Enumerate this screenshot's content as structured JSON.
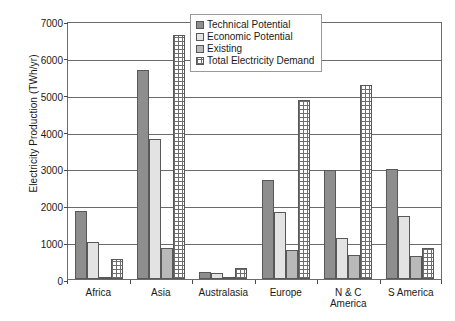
{
  "chart_data": {
    "type": "bar",
    "title": "",
    "xlabel": "",
    "ylabel": "Electricity Production (TWh/yr)",
    "ylim": [
      0,
      7000
    ],
    "ytick_values": [
      0,
      1000,
      2000,
      3000,
      4000,
      5000,
      6000,
      7000
    ],
    "ytick_labels": [
      "0",
      "1000",
      "2000",
      "3000",
      "4000",
      "5000",
      "6000",
      "7000"
    ],
    "grid": true,
    "legend_position": "top-center",
    "categories": [
      "Africa",
      "Asia",
      "Australasia",
      "Europe",
      "N & C America",
      "S America"
    ],
    "category_labels_multiline": [
      [
        "Africa"
      ],
      [
        "Asia"
      ],
      [
        "Australasia"
      ],
      [
        "Europe"
      ],
      [
        "N & C",
        "America"
      ],
      [
        "S America"
      ]
    ],
    "series": [
      {
        "name": "Technical Potential",
        "pattern": "solid-dark-gray",
        "values": [
          1850,
          5680,
          200,
          2680,
          2970,
          2980
        ]
      },
      {
        "name": "Economic Potential",
        "pattern": "dotted-stipple",
        "values": [
          1000,
          3800,
          150,
          1820,
          1100,
          1720
        ]
      },
      {
        "name": "Existing",
        "pattern": "solid-light-gray",
        "values": [
          60,
          830,
          40,
          800,
          650,
          620
        ]
      },
      {
        "name": "Total Electricity Demand",
        "pattern": "crosshatch",
        "values": [
          550,
          6630,
          300,
          4850,
          5270,
          830
        ]
      }
    ]
  },
  "colors": {
    "series_technical": "#8e8e8e",
    "series_economic": "#e3e3e3",
    "series_existing": "#b9b9b9",
    "series_demand": "#ffffff",
    "axis": "#6b6b6b",
    "text": "#1a1a1a"
  }
}
